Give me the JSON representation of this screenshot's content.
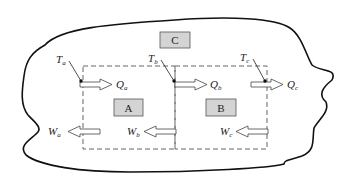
{
  "diagram": {
    "subsystems": [
      {
        "id": "C",
        "label": "C"
      },
      {
        "id": "A",
        "label": "A"
      },
      {
        "id": "B",
        "label": "B"
      }
    ],
    "temperatures": [
      {
        "symbol": "T",
        "sub": "a"
      },
      {
        "symbol": "T",
        "sub": "b"
      },
      {
        "symbol": "T",
        "sub": "c"
      }
    ],
    "heat_flows": [
      {
        "symbol": "Q",
        "sub": "a",
        "direction": "right"
      },
      {
        "symbol": "Q",
        "sub": "b",
        "direction": "right"
      },
      {
        "symbol": "Q",
        "sub": "c",
        "direction": "right"
      }
    ],
    "work_flows": [
      {
        "symbol": "W",
        "sub": "a",
        "direction": "left"
      },
      {
        "symbol": "W",
        "sub": "b",
        "direction": "left"
      },
      {
        "symbol": "W",
        "sub": "c",
        "direction": "left"
      }
    ],
    "colors": {
      "box_fill": "#d4d4d4",
      "box_stroke": "#555555",
      "line": "#111111",
      "dash": "#666666"
    }
  }
}
